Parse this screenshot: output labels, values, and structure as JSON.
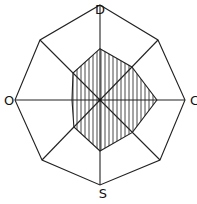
{
  "diagram": {
    "type": "radar-octagon",
    "axis_labels": {
      "top": "D",
      "right": "C",
      "bottom": "S",
      "left": "O"
    },
    "axes_count": 8,
    "shaded_profile": {
      "description": "hatched polygon showing relative levels along each of 8 axes (fraction of full radius)",
      "axes_order": [
        "top",
        "top-right",
        "right",
        "bottom-right",
        "bottom",
        "bottom-left",
        "left",
        "top-left"
      ],
      "values": [
        0.54,
        0.55,
        0.67,
        0.54,
        0.6,
        0.45,
        0.33,
        0.45
      ]
    },
    "colors": {
      "stroke": "#222222",
      "hatch": "#333333",
      "background": "#ffffff"
    }
  }
}
